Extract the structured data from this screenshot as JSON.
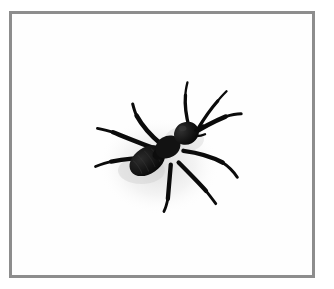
{
  "image": {
    "kind": "photograph",
    "subject_label": "ant",
    "background_color": "#ffffff",
    "canvas_color": "#fefefe",
    "width": 334,
    "height": 289
  },
  "frame": {
    "name": "photo-border",
    "border_color": "#8d8d8d",
    "border_width_px": 3,
    "left_px": 9,
    "top_px": 11,
    "width_px": 306,
    "height_px": 267
  },
  "subject": {
    "name": "ant",
    "common_name": "ant",
    "silhouette_color": "#0d0d0d",
    "shadow_color": "#d9d9d9",
    "orientation": "head toward upper-right, gaster toward lower-left",
    "bounding_box_px": {
      "x": 132,
      "y": 100,
      "width": 90,
      "height": 85
    },
    "parts": [
      {
        "name": "head",
        "center_px": [
          185,
          127
        ],
        "radius_px": 13
      },
      {
        "name": "thorax",
        "center_px": [
          166,
          143
        ],
        "radius_px": 12
      },
      {
        "name": "petiole",
        "center_px": [
          157,
          150
        ],
        "radius_px": 5
      },
      {
        "name": "gaster",
        "center_px": [
          147,
          161
        ],
        "radius_px": 15
      }
    ],
    "antenna_count": 2,
    "leg_count": 6
  }
}
